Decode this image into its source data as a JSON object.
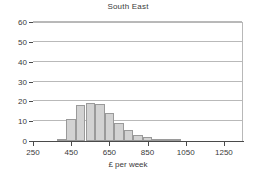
{
  "chart_data": {
    "type": "bar",
    "title": "South East",
    "xlabel": "£ per week",
    "ylabel": "",
    "xlim": [
      250,
      1350
    ],
    "ylim": [
      0,
      60
    ],
    "grid": true,
    "legend": "none",
    "bin_width": 50,
    "y_ticks": [
      0,
      10,
      20,
      30,
      40,
      50,
      60
    ],
    "x_ticks": [
      250,
      450,
      650,
      850,
      1050,
      1250
    ],
    "x_tick_labels": [
      "250",
      "450",
      "650",
      "850",
      "1050",
      "1250"
    ],
    "y_tick_labels": [
      "0",
      "10",
      "20",
      "30",
      "40",
      "50",
      "60"
    ],
    "bin_starts": [
      375,
      425,
      475,
      525,
      575,
      625,
      675,
      725,
      775,
      825,
      875,
      925,
      975
    ],
    "categories": [
      "375-425",
      "425-475",
      "475-525",
      "525-575",
      "575-625",
      "625-675",
      "675-725",
      "725-775",
      "775-825",
      "825-875",
      "875-925",
      "925-975",
      "975-1025"
    ],
    "values": [
      0.8,
      11.3,
      18.0,
      19.0,
      18.5,
      14.0,
      9.2,
      5.4,
      3.0,
      1.8,
      0.7,
      0.6,
      0.5
    ],
    "series_name": "South East",
    "bar_fill_color": "#d2d2d2",
    "bar_border_color": "#9a9a9a",
    "gridline_color": "#b9b9b9",
    "axis_color": "#4a4a4a",
    "text_color": "#3a3a3a",
    "background_color": "#ffffff"
  }
}
